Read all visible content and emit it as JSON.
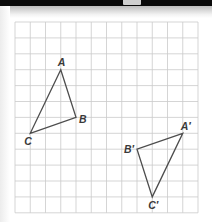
{
  "grid": {
    "columns": 12,
    "rows": 12,
    "origin_px": [
      15,
      22
    ],
    "cell_w": 15.25,
    "cell_h": 15.9,
    "line_color": "#cacaca"
  },
  "triangles": [
    {
      "name": "ABC",
      "stroke": "#4d4d4d",
      "vertices": [
        {
          "label": "A",
          "col": 3,
          "row": 3,
          "label_dx": -3,
          "label_dy": -4
        },
        {
          "label": "B",
          "col": 4,
          "row": 6,
          "label_dx": 3,
          "label_dy": 6
        },
        {
          "label": "C",
          "col": 1,
          "row": 7,
          "label_dx": -6,
          "label_dy": 12
        }
      ]
    },
    {
      "name": "A'B'C'",
      "stroke": "#4d4d4d",
      "vertices": [
        {
          "label": "A′",
          "col": 11,
          "row": 7,
          "label_dx": -2,
          "label_dy": -3
        },
        {
          "label": "B′",
          "col": 8,
          "row": 8,
          "label_dx": -13,
          "label_dy": 4
        },
        {
          "label": "C′",
          "col": 9,
          "row": 11,
          "label_dx": -4,
          "label_dy": 12
        }
      ]
    }
  ],
  "labels": {
    "A": "A",
    "B": "B",
    "C": "C",
    "A_prime": "A′",
    "B_prime": "B′",
    "C_prime": "C′"
  }
}
